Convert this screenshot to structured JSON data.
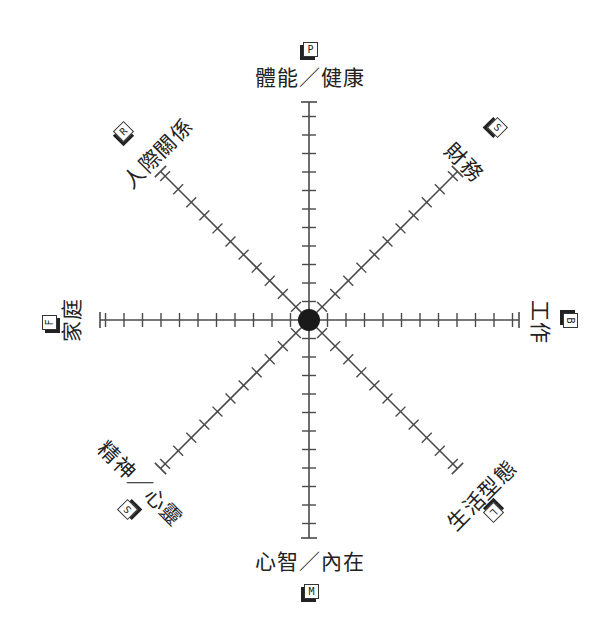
{
  "diagram": {
    "title": "",
    "center": {
      "x": 309,
      "y": 320
    },
    "colors": {
      "line": "#4a4a4a",
      "hub": "#1a1a1a",
      "text": "#222222"
    },
    "tick_spacing": 18.5,
    "axes": [
      {
        "id": "physical",
        "label": "體能／健康",
        "badge": "P",
        "angle": -90,
        "length": 218
      },
      {
        "id": "finance",
        "label": "財務",
        "badge": "S",
        "angle": -45,
        "length": 210
      },
      {
        "id": "work",
        "label": "工作",
        "badge": "B",
        "angle": 0,
        "length": 210
      },
      {
        "id": "lifestyle",
        "label": "生活型態",
        "badge": "L",
        "angle": 45,
        "length": 210
      },
      {
        "id": "mind",
        "label": "心智／內在",
        "badge": "M",
        "angle": 90,
        "length": 218
      },
      {
        "id": "spirit",
        "label": "精神／心靈",
        "badge": "S",
        "angle": 135,
        "length": 210
      },
      {
        "id": "family",
        "label": "家庭",
        "badge": "F",
        "angle": 180,
        "length": 209
      },
      {
        "id": "relationships",
        "label": "人際關係",
        "badge": "R",
        "angle": -135,
        "length": 210
      }
    ]
  }
}
